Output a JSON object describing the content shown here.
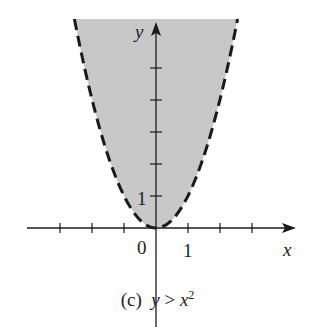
{
  "figure": {
    "caption_prefix": "(c)",
    "caption_lhs": "y",
    "caption_op": ">",
    "caption_rhs_base": "x",
    "caption_rhs_exp": "2",
    "axes": {
      "x_label": "x",
      "y_label": "y",
      "origin_label": "0",
      "x_tick_label": "1",
      "y_tick_label": "1"
    },
    "colors": {
      "shade": "#c8c8c8",
      "curve": "#1a1a1a",
      "axis": "#1a1a1a"
    },
    "curve": {
      "equation": "y = x^2",
      "style": "dashed",
      "region": "above curve shaded"
    }
  }
}
